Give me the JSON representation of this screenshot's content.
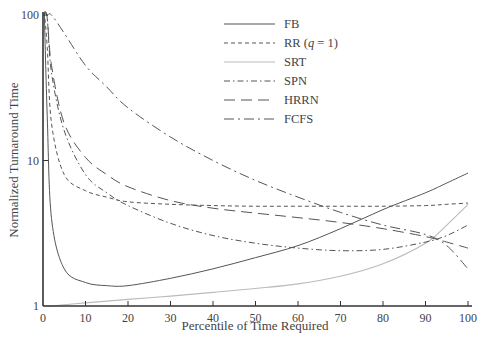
{
  "chart_data": {
    "type": "line",
    "title": "",
    "xlabel": "Percentile of Time Required",
    "ylabel": "Normalized Turnaround Time",
    "xlim": [
      0,
      100
    ],
    "ylim": [
      1,
      100
    ],
    "yscale": "log",
    "grid": false,
    "legend_position": "upper-center",
    "x_ticks": [
      "0",
      "10",
      "20",
      "30",
      "40",
      "50",
      "60",
      "70",
      "80",
      "90",
      "100"
    ],
    "y_ticks": [
      "1",
      "10",
      "100"
    ],
    "x": [
      1,
      2,
      5,
      10,
      15,
      20,
      30,
      40,
      50,
      60,
      70,
      80,
      90,
      95,
      100
    ],
    "series": [
      {
        "name": "FB",
        "style": "solid",
        "color": "#555555",
        "values": [
          20,
          4.0,
          1.8,
          1.45,
          1.38,
          1.38,
          1.55,
          1.8,
          2.15,
          2.6,
          3.4,
          4.6,
          6.0,
          7.0,
          8.2
        ]
      },
      {
        "name": "RR (q = 1)",
        "style": "short-dash",
        "color": "#555555",
        "values": [
          60,
          18,
          8.0,
          6.2,
          5.6,
          5.2,
          5.0,
          4.9,
          4.85,
          4.85,
          4.85,
          4.85,
          4.9,
          5.0,
          5.1
        ]
      },
      {
        "name": "SRT",
        "style": "solid-light",
        "color": "#bbbbbb",
        "values": [
          1.0,
          1.0,
          1.02,
          1.05,
          1.08,
          1.11,
          1.17,
          1.24,
          1.32,
          1.42,
          1.6,
          1.95,
          2.7,
          3.6,
          5.0
        ]
      },
      {
        "name": "SPN",
        "style": "dash-dot",
        "color": "#555555",
        "values": [
          95,
          40,
          16,
          8.0,
          6.0,
          4.9,
          3.7,
          3.05,
          2.7,
          2.5,
          2.4,
          2.45,
          2.75,
          3.05,
          3.6
        ]
      },
      {
        "name": "HRRN",
        "style": "long-dash",
        "color": "#555555",
        "values": [
          95,
          45,
          18,
          10.5,
          8.0,
          6.6,
          5.3,
          4.7,
          4.35,
          4.05,
          3.75,
          3.4,
          3.0,
          2.75,
          2.5
        ]
      },
      {
        "name": "FCFS",
        "style": "long-dash-dot",
        "color": "#555555",
        "values": [
          100,
          100,
          75,
          45,
          32,
          23,
          14.5,
          10.0,
          7.3,
          5.6,
          4.4,
          3.6,
          3.1,
          2.6,
          1.8
        ]
      }
    ],
    "legend": [
      "FB",
      "RR (q = 1)",
      "SRT",
      "SPN",
      "HRRN",
      "FCFS"
    ]
  }
}
